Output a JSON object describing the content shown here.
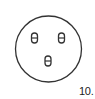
{
  "figure": {
    "label": "10.",
    "outline_color": "#333333",
    "background": "#ffffff",
    "circle": {
      "cx": 48.5,
      "cy": 49,
      "r": 33
    },
    "pins": [
      {
        "name": "pin-top-left",
        "cx": 34.5,
        "cy": 38
      },
      {
        "name": "pin-top-right",
        "cx": 61.5,
        "cy": 38
      },
      {
        "name": "pin-bottom",
        "cx": 48,
        "cy": 61
      }
    ]
  }
}
